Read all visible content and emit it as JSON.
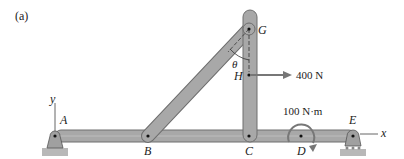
{
  "figure": {
    "panel_label": "(a)",
    "colors": {
      "member_fill": "#a8a8a8",
      "member_stroke": "#6e6e6e",
      "ground_fill": "#b8b8b8",
      "axis_line": "#666666",
      "ink": "#222222"
    },
    "points": {
      "A": "A",
      "B": "B",
      "C": "C",
      "D": "D",
      "E": "E",
      "G": "G",
      "H": "H"
    },
    "axes": {
      "x": "x",
      "y": "y"
    },
    "angle": "θ",
    "force": {
      "label": "400 N",
      "point": "H",
      "direction": "right"
    },
    "moment": {
      "label": "100 N·m",
      "point": "D",
      "direction": "clockwise"
    },
    "supports": [
      {
        "point": "A",
        "type": "pin"
      },
      {
        "point": "E",
        "type": "roller"
      }
    ],
    "members": [
      {
        "name": "AE",
        "type": "horizontal beam"
      },
      {
        "name": "BG",
        "type": "inclined member"
      },
      {
        "name": "CG",
        "type": "vertical member"
      }
    ]
  }
}
